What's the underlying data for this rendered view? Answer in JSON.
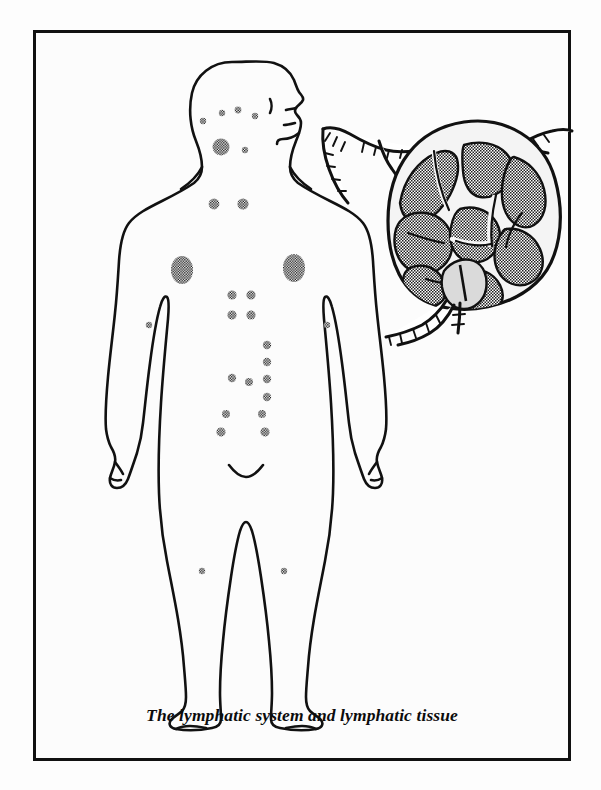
{
  "plate": {
    "caption": "The lymphatic system and lymphatic tissue",
    "border_color": "#111111",
    "background_color": "#fcfcfc",
    "ink_color": "#111111",
    "stipple_color": "#1a1a1a"
  },
  "diagram": {
    "type": "anatomical-illustration",
    "subject": "lymphatic system",
    "panels": [
      {
        "id": "body-figure",
        "name": "human-body-outline",
        "description": "Full-body anterior outline of a human figure shown in line art, head in right-facing profile, arms at sides, marked with stippled lymph node clusters"
      },
      {
        "id": "lymph-node",
        "name": "lymph-node-cross-section",
        "description": "Magnified cross-section of a lymph node with stippled cortical lobules, medullary sinuses, capsule, afferent lymphatic vessels entering at top and efferent vessels leaving at the hilum"
      }
    ],
    "node_markers": [
      {
        "name": "occipital-node-marker",
        "cx": 167,
        "cy": 88,
        "rx": 3.2,
        "ry": 3.2
      },
      {
        "name": "preauricular-node-marker",
        "cx": 186,
        "cy": 80,
        "rx": 3.2,
        "ry": 3.2
      },
      {
        "name": "parotid-node-marker",
        "cx": 202,
        "cy": 77,
        "rx": 3.4,
        "ry": 3.4
      },
      {
        "name": "facial-node-marker",
        "cx": 219,
        "cy": 83,
        "rx": 3.2,
        "ry": 3.2
      },
      {
        "name": "submental-node-marker",
        "cx": 208,
        "cy": 116,
        "rx": 3.2,
        "ry": 3.2
      },
      {
        "name": "cervical-node-cluster",
        "cx": 185,
        "cy": 114,
        "rx": 8.5,
        "ry": 8.5
      },
      {
        "name": "supraclavicular-node-left",
        "cx": 178,
        "cy": 171,
        "rx": 5.5,
        "ry": 5.5
      },
      {
        "name": "supraclavicular-node-right",
        "cx": 207,
        "cy": 171,
        "rx": 5.5,
        "ry": 5.5
      },
      {
        "name": "axillary-node-left",
        "cx": 146,
        "cy": 237,
        "rx": 11,
        "ry": 14
      },
      {
        "name": "axillary-node-right",
        "cx": 258,
        "cy": 235,
        "rx": 11,
        "ry": 14
      },
      {
        "name": "epitrochlear-node-left",
        "cx": 113,
        "cy": 292,
        "rx": 3.2,
        "ry": 3.2
      },
      {
        "name": "epitrochlear-node-right",
        "cx": 291,
        "cy": 292,
        "rx": 3.2,
        "ry": 3.2
      },
      {
        "name": "upper-abdominal-node-1",
        "cx": 196,
        "cy": 262,
        "rx": 4.6,
        "ry": 4.6
      },
      {
        "name": "upper-abdominal-node-2",
        "cx": 215,
        "cy": 262,
        "rx": 4.6,
        "ry": 4.6
      },
      {
        "name": "upper-abdominal-node-3",
        "cx": 196,
        "cy": 282,
        "rx": 4.6,
        "ry": 4.6
      },
      {
        "name": "upper-abdominal-node-4",
        "cx": 215,
        "cy": 282,
        "rx": 4.6,
        "ry": 4.6
      },
      {
        "name": "para-aortic-node-1",
        "cx": 231,
        "cy": 313,
        "rx": 4.2,
        "ry": 4.2
      },
      {
        "name": "para-aortic-node-2",
        "cx": 231,
        "cy": 330,
        "rx": 4.2,
        "ry": 4.2
      },
      {
        "name": "para-aortic-node-3",
        "cx": 231,
        "cy": 347,
        "rx": 4.2,
        "ry": 4.2
      },
      {
        "name": "para-aortic-node-4",
        "cx": 231,
        "cy": 346,
        "rx": 4.2,
        "ry": 4.2
      },
      {
        "name": "mesenteric-node-1",
        "cx": 197,
        "cy": 345,
        "rx": 4.2,
        "ry": 4.2
      },
      {
        "name": "mesenteric-node-2",
        "cx": 213,
        "cy": 348,
        "rx": 4.2,
        "ry": 4.2
      },
      {
        "name": "mesenteric-node-3",
        "cx": 231,
        "cy": 364,
        "rx": 4.2,
        "ry": 4.2
      },
      {
        "name": "iliac-node-left",
        "cx": 190,
        "cy": 381,
        "rx": 4,
        "ry": 4
      },
      {
        "name": "iliac-node-right",
        "cx": 226,
        "cy": 381,
        "rx": 4,
        "ry": 4
      },
      {
        "name": "inguinal-node-left",
        "cx": 185,
        "cy": 399,
        "rx": 4.6,
        "ry": 4.6
      },
      {
        "name": "inguinal-node-right",
        "cx": 229,
        "cy": 399,
        "rx": 4.6,
        "ry": 4.6
      },
      {
        "name": "popliteal-node-left",
        "cx": 166,
        "cy": 538,
        "rx": 3.2,
        "ry": 3.2
      },
      {
        "name": "popliteal-node-right",
        "cx": 248,
        "cy": 538,
        "rx": 3.2,
        "ry": 3.2
      }
    ]
  }
}
